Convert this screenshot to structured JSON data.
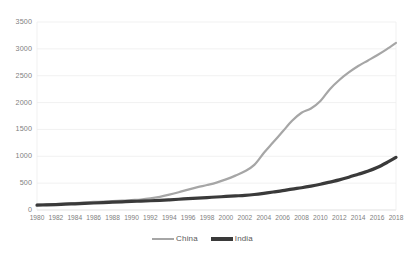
{
  "chart_data": {
    "type": "line",
    "title": "",
    "subtitle": "",
    "xlabel": "",
    "ylabel": "",
    "xlim": [
      1980,
      2018
    ],
    "ylim": [
      0,
      3500
    ],
    "yticks": [
      0,
      500,
      1000,
      1500,
      2000,
      2500,
      3000,
      3500
    ],
    "ytick_labels": [
      "0",
      "500",
      "1000",
      "1500",
      "2000",
      "2500",
      "3000",
      "3500"
    ],
    "grid": true,
    "grid_axis": "y",
    "legend_position": "bottom",
    "x": [
      1980,
      1981,
      1982,
      1983,
      1984,
      1985,
      1986,
      1987,
      1988,
      1989,
      1990,
      1991,
      1992,
      1993,
      1994,
      1995,
      1996,
      1997,
      1998,
      1999,
      2000,
      2001,
      2002,
      2003,
      2004,
      2005,
      2006,
      2007,
      2008,
      2009,
      2010,
      2011,
      2012,
      2013,
      2014,
      2015,
      2016,
      2017,
      2018
    ],
    "xtick_labels": [
      "1980",
      "1982",
      "1984",
      "1986",
      "1988",
      "1990",
      "1992",
      "1994",
      "1996",
      "1998",
      "2000",
      "2002",
      "2004",
      "2006",
      "2008",
      "2010",
      "2012",
      "2014",
      "2016",
      "2018"
    ],
    "series": [
      {
        "name": "China",
        "color": "#a6a6a6",
        "width": 2.2,
        "values": [
          100,
          105,
          110,
          118,
          128,
          140,
          150,
          158,
          168,
          175,
          185,
          195,
          215,
          245,
          285,
          330,
          380,
          425,
          465,
          510,
          570,
          640,
          720,
          840,
          1060,
          1260,
          1460,
          1660,
          1810,
          1890,
          2030,
          2250,
          2420,
          2560,
          2680,
          2780,
          2880,
          2990,
          3110
        ]
      },
      {
        "name": "India",
        "color": "#3a3a3a",
        "width": 3.2,
        "values": [
          90,
          95,
          100,
          108,
          115,
          122,
          130,
          138,
          145,
          152,
          160,
          165,
          172,
          180,
          190,
          200,
          212,
          222,
          232,
          242,
          252,
          262,
          272,
          288,
          310,
          335,
          360,
          390,
          415,
          445,
          480,
          520,
          560,
          610,
          665,
          720,
          790,
          880,
          980
        ]
      }
    ],
    "annotations": []
  }
}
